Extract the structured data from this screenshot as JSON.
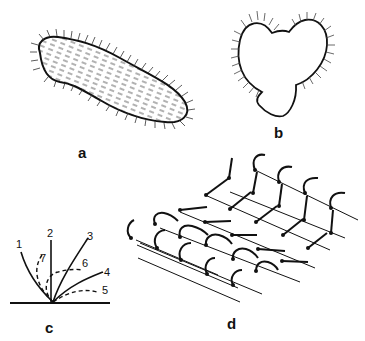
{
  "figure": {
    "panels": [
      {
        "id": "a",
        "label": "a",
        "description": "ciliated slipper-shaped organism (Paramecium-like) covered with cilia"
      },
      {
        "id": "b",
        "label": "b",
        "description": "heart-shaped ciliated larva outline with marginal cilia"
      },
      {
        "id": "c",
        "label": "c",
        "description": "sequence of cilium beat positions numbered 1-7 (solid = effective stroke, dashed = recovery stroke)",
        "positions": [
          "1",
          "2",
          "3",
          "4",
          "5",
          "6",
          "7"
        ]
      },
      {
        "id": "d",
        "label": "d",
        "description": "metachronal waves of cilia arranged in rows"
      }
    ],
    "colors": {
      "ink": "#111111",
      "background": "#ffffff"
    }
  }
}
